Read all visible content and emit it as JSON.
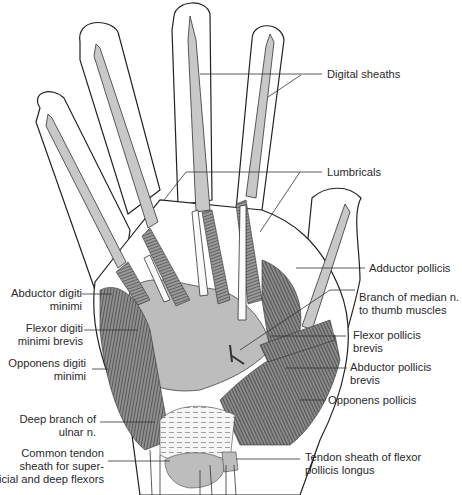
{
  "figure": {
    "colors": {
      "outline": "#222222",
      "sheath_fill": "#c8c8c8",
      "muscle_dark": "#555555",
      "muscle_mid": "#8a8a8a",
      "aponeurosis": "#bdbdbd",
      "retinaculum": "#f4f4f4",
      "leader_line": "#333333",
      "label_text": "#2a2a2a"
    }
  },
  "labels": {
    "digital_sheaths": "Digital sheaths",
    "lumbricals": "Lumbricals",
    "adductor_pollicis": "Adductor pollicis",
    "branch_median": "Branch of median n.\nto thumb muscles",
    "flexor_pollicis_brevis": "Flexor pollicis\nbrevis",
    "abductor_pollicis_brevis": "Abductor pollicis\nbrevis",
    "opponens_pollicis": "Opponens pollicis",
    "tendon_sheath_fpl": "Tendon sheath of flexor\npollicis longus",
    "abductor_digiti_minimi": "Abductor digiti\nminimi",
    "flexor_digiti_minimi_brevis": "Flexor digiti\nminimi brevis",
    "opponens_digiti_minimi": "Opponens digiti\nminimi",
    "deep_branch_ulnar": "Deep branch of\nulnar n.",
    "common_tendon_sheath": "Common tendon\nsheath for super-\nficial and deep flexors"
  }
}
